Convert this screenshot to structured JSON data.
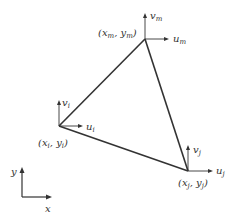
{
  "diagram": {
    "type": "triangular finite element with nodal displacements",
    "colors": {
      "line": "#333333",
      "background": "#ffffff"
    },
    "nodes": [
      {
        "id": "i",
        "coord_label": {
          "x": "x",
          "xs": "i",
          "y": "y",
          "ys": "i"
        },
        "u_label": {
          "base": "u",
          "sub": "i"
        },
        "v_label": {
          "base": "v",
          "sub": "i"
        }
      },
      {
        "id": "j",
        "coord_label": {
          "x": "x",
          "xs": "j",
          "y": "y",
          "ys": "j"
        },
        "u_label": {
          "base": "u",
          "sub": "j"
        },
        "v_label": {
          "base": "v",
          "sub": "j"
        }
      },
      {
        "id": "m",
        "coord_label": {
          "x": "x",
          "xs": "m",
          "y": "y",
          "ys": "m"
        },
        "u_label": {
          "base": "u",
          "sub": "m"
        },
        "v_label": {
          "base": "v",
          "sub": "m"
        }
      }
    ],
    "edges": [
      [
        "i",
        "m"
      ],
      [
        "m",
        "j"
      ],
      [
        "j",
        "i"
      ]
    ],
    "axes": {
      "x_label": "x",
      "y_label": "y"
    }
  }
}
